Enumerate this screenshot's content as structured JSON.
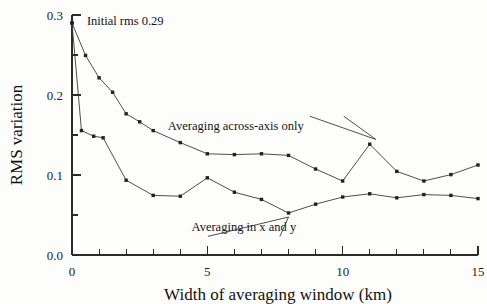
{
  "chart_data": {
    "type": "line",
    "title": "",
    "xlabel": "Width of averaging window (km)",
    "ylabel": "RMS variation",
    "xlim": [
      0,
      15
    ],
    "ylim": [
      0.0,
      0.3
    ],
    "grid": false,
    "legend_position": "inline-annotations",
    "x_ticks_major": [
      "0",
      "5",
      "10",
      "15"
    ],
    "x_tick_values_major": [
      0,
      5,
      10,
      15
    ],
    "x_tick_values_minor": [
      1,
      2,
      3,
      4,
      6,
      7,
      8,
      9,
      11,
      12,
      13,
      14
    ],
    "y_ticks_major": [
      "0.0",
      "0.1",
      "0.2",
      "0.3"
    ],
    "y_tick_values_major": [
      0.0,
      0.1,
      0.2,
      0.3
    ],
    "y_tick_values_minor": [
      0.05,
      0.15,
      0.25
    ],
    "annotations": [
      {
        "name": "initial-rms-note",
        "text": "Initial rms 0.29",
        "x": 0.55,
        "y": 0.292
      }
    ],
    "series": [
      {
        "name": "Averaging across-axis only",
        "label_x": 6.05,
        "label_y": 0.161,
        "leader_from_x": 11.45,
        "leader_from_y": 0.1505,
        "leader_to_x": 11.0,
        "leader_to_y": 0.1385,
        "x": [
          0,
          0.5,
          1,
          1.5,
          2,
          2.5,
          3,
          4,
          5,
          6,
          7,
          8,
          9,
          10,
          11,
          12,
          13,
          14,
          15
        ],
        "y": [
          0.29,
          0.2495,
          0.2215,
          0.2035,
          0.1765,
          0.1665,
          0.1555,
          0.1405,
          0.1265,
          0.1255,
          0.1265,
          0.1245,
          0.1075,
          0.0925,
          0.1385,
          0.1045,
          0.0925,
          0.1005,
          0.1125
        ]
      },
      {
        "name": "Averaging in x and y",
        "label_x": 6.35,
        "label_y": 0.0345,
        "leader_from_x": 8.0,
        "leader_from_y": 0.0425,
        "leader_to_x": 8.0,
        "leader_to_y": 0.0525,
        "x": [
          0,
          0.35,
          0.8,
          1.15,
          2,
          3,
          4,
          5,
          6,
          7,
          8,
          9,
          10,
          11,
          12,
          13,
          14,
          15
        ],
        "y": [
          0.29,
          0.1555,
          0.1485,
          0.1465,
          0.0935,
          0.0745,
          0.0735,
          0.0965,
          0.0785,
          0.0695,
          0.0525,
          0.0635,
          0.0725,
          0.0765,
          0.0715,
          0.0755,
          0.0745,
          0.0705
        ]
      }
    ]
  },
  "figure": {
    "background_color": "#fdfdfc",
    "ink_color": "#2b2b2b"
  }
}
